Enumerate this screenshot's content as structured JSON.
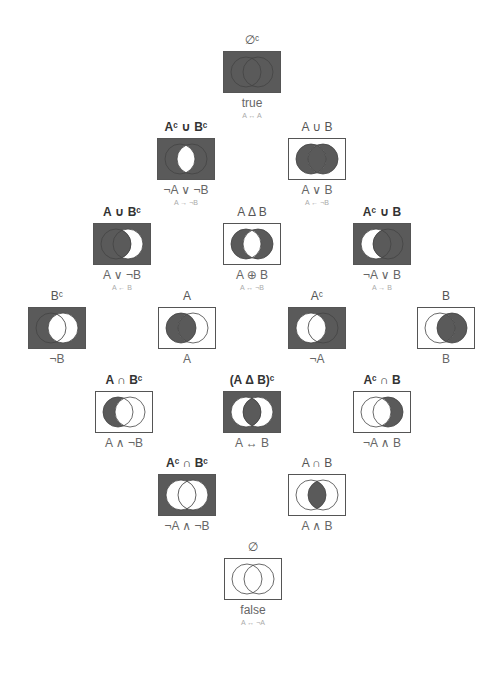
{
  "colors": {
    "fill": "#5a5a5a",
    "empty": "#ffffff",
    "stroke": "#444444",
    "frame": "#555555"
  },
  "nodes": [
    {
      "id": "universe",
      "x": 252,
      "y": 33,
      "set": "∅ᶜ",
      "bold": false,
      "logic": "true",
      "equiv": "A ↔ A",
      "regions": [
        1,
        1,
        1,
        1
      ]
    },
    {
      "id": "nand",
      "x": 186,
      "y": 120,
      "set": "Aᶜ ∪ Bᶜ",
      "bold": true,
      "logic": "¬A ∨ ¬B",
      "equiv": "A → ¬B",
      "regions": [
        1,
        1,
        0,
        1
      ]
    },
    {
      "id": "or",
      "x": 317,
      "y": 120,
      "set": "A ∪ B",
      "bold": false,
      "logic": "A ∨ B",
      "equiv": "A ← ¬B",
      "regions": [
        0,
        1,
        1,
        1
      ]
    },
    {
      "id": "a-or-not-b",
      "x": 122,
      "y": 205,
      "set": "A ∪ Bᶜ",
      "bold": true,
      "logic": "A ∨ ¬B",
      "equiv": "A ← B",
      "regions": [
        1,
        1,
        1,
        0
      ]
    },
    {
      "id": "xor",
      "x": 252,
      "y": 205,
      "set": "A Δ B",
      "bold": false,
      "logic": "A ⊕ B",
      "equiv": "A ↔ ¬B",
      "regions": [
        0,
        1,
        0,
        1
      ]
    },
    {
      "id": "not-a-or-b",
      "x": 382,
      "y": 205,
      "set": "Aᶜ ∪ B",
      "bold": true,
      "logic": "¬A ∨ B",
      "equiv": "A → B",
      "regions": [
        1,
        0,
        1,
        1
      ]
    },
    {
      "id": "not-b",
      "x": 57,
      "y": 289,
      "set": "Bᶜ",
      "bold": false,
      "logic": "¬B",
      "equiv": "",
      "regions": [
        1,
        1,
        0,
        0
      ]
    },
    {
      "id": "a",
      "x": 187,
      "y": 289,
      "set": "A",
      "bold": false,
      "logic": "A",
      "equiv": "",
      "regions": [
        0,
        1,
        1,
        0
      ]
    },
    {
      "id": "not-a",
      "x": 317,
      "y": 289,
      "set": "Aᶜ",
      "bold": false,
      "logic": "¬A",
      "equiv": "",
      "regions": [
        1,
        0,
        0,
        1
      ]
    },
    {
      "id": "b",
      "x": 446,
      "y": 289,
      "set": "B",
      "bold": false,
      "logic": "B",
      "equiv": "",
      "regions": [
        0,
        0,
        1,
        1
      ]
    },
    {
      "id": "a-and-not-b",
      "x": 124,
      "y": 373,
      "set": "A ∩ Bᶜ",
      "bold": true,
      "logic": "A ∧ ¬B",
      "equiv": "",
      "regions": [
        0,
        1,
        0,
        0
      ]
    },
    {
      "id": "xnor",
      "x": 252,
      "y": 373,
      "set": "(A Δ B)ᶜ",
      "bold": true,
      "logic": "A ↔ B",
      "equiv": "",
      "regions": [
        1,
        0,
        1,
        0
      ]
    },
    {
      "id": "not-a-and-b",
      "x": 382,
      "y": 373,
      "set": "Aᶜ ∩ B",
      "bold": true,
      "logic": "¬A ∧ B",
      "equiv": "",
      "regions": [
        0,
        0,
        0,
        1
      ]
    },
    {
      "id": "nor",
      "x": 187,
      "y": 456,
      "set": "Aᶜ ∩ Bᶜ",
      "bold": true,
      "logic": "¬A ∧ ¬B",
      "equiv": "",
      "regions": [
        1,
        0,
        0,
        0
      ]
    },
    {
      "id": "and",
      "x": 317,
      "y": 456,
      "set": "A ∩ B",
      "bold": false,
      "logic": "A ∧ B",
      "equiv": "",
      "regions": [
        0,
        0,
        1,
        0
      ]
    },
    {
      "id": "empty",
      "x": 253,
      "y": 540,
      "set": "∅",
      "bold": false,
      "logic": "false",
      "equiv": "A ↔ ¬A",
      "regions": [
        0,
        0,
        0,
        0
      ]
    }
  ],
  "legend": {
    "regions_order": [
      "outside",
      "A only",
      "A and B",
      "B only"
    ]
  }
}
